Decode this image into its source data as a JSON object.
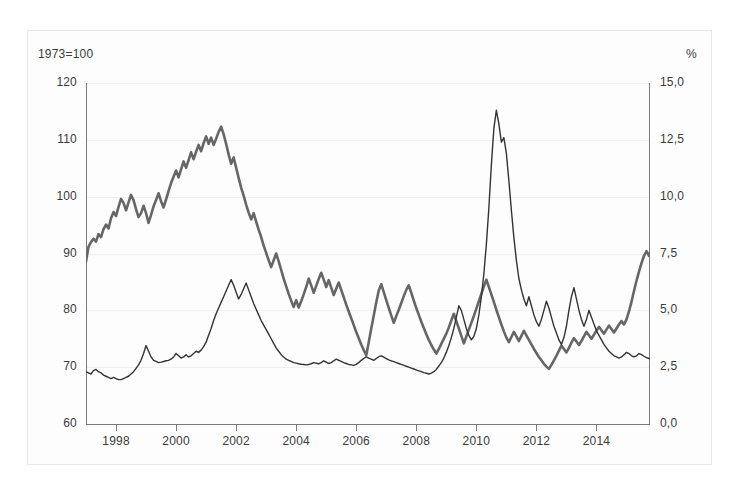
{
  "chart_data": {
    "type": "line",
    "title": "",
    "subtitle": "",
    "left_axis": {
      "caption": "1973=100",
      "label": "1973=100",
      "ticks": [
        "120",
        "110",
        "100",
        "90",
        "80",
        "70",
        "60"
      ],
      "tick_values": [
        120,
        110,
        100,
        90,
        80,
        70,
        60
      ],
      "ylim": [
        60,
        120
      ]
    },
    "right_axis": {
      "caption": "%",
      "label": "%",
      "ticks": [
        "15,0",
        "12,5",
        "10,0",
        "7,5",
        "5,0",
        "2,5",
        "0,0"
      ],
      "tick_values": [
        15.0,
        12.5,
        10.0,
        7.5,
        5.0,
        2.5,
        0.0
      ],
      "ylim": [
        0,
        15
      ]
    },
    "xlabel": "",
    "x_ticks": [
      "1998",
      "2000",
      "2002",
      "2004",
      "2006",
      "2008",
      "2010",
      "2012",
      "2014"
    ],
    "x_tick_values": [
      1998,
      2000,
      2002,
      2004,
      2006,
      2008,
      2010,
      2012,
      2014
    ],
    "xlim": [
      1997.0,
      2015.75
    ],
    "grid": true,
    "legend_position": "none",
    "colors": {
      "index_series": "#666666",
      "rate_series": "#333333",
      "grid": "#f0f0f0",
      "axis": "#7a7a7a",
      "frame": "#e8e8e8",
      "background": "#fdfdfd",
      "text": "#3a3a3a"
    },
    "series": [
      {
        "name": "Index (1973=100)",
        "axis": "left",
        "color": "#666666",
        "width": 2.6,
        "x_start": 1997.0,
        "x_step": 0.0833333,
        "values": [
          88.6,
          91.2,
          92.0,
          92.6,
          92.1,
          93.4,
          92.9,
          94.3,
          95.1,
          94.4,
          96.2,
          97.3,
          96.6,
          98.2,
          99.6,
          98.9,
          97.6,
          99.0,
          100.3,
          99.4,
          97.8,
          96.4,
          97.1,
          98.4,
          97.1,
          95.4,
          96.8,
          98.3,
          99.4,
          100.6,
          99.2,
          98.1,
          99.5,
          101.0,
          102.4,
          103.5,
          104.6,
          103.4,
          104.8,
          106.2,
          105.1,
          106.4,
          107.8,
          106.6,
          107.9,
          109.1,
          108.0,
          109.4,
          110.6,
          109.3,
          110.4,
          109.1,
          110.2,
          111.4,
          112.3,
          111.0,
          109.3,
          107.4,
          105.8,
          106.9,
          105.1,
          103.3,
          101.6,
          100.2,
          98.6,
          97.2,
          96.0,
          97.1,
          95.6,
          94.2,
          92.9,
          91.4,
          90.1,
          88.8,
          87.6,
          88.8,
          90.0,
          88.6,
          87.1,
          85.6,
          84.2,
          82.9,
          81.7,
          80.6,
          81.8,
          80.5,
          81.6,
          82.8,
          84.1,
          85.6,
          84.4,
          83.1,
          84.3,
          85.5,
          86.6,
          85.4,
          84.1,
          85.3,
          84.0,
          82.7,
          83.8,
          84.9,
          83.6,
          82.3,
          81.0,
          79.8,
          78.6,
          77.4,
          76.2,
          75.1,
          74.0,
          73.0,
          72.1,
          74.4,
          76.8,
          79.1,
          81.4,
          83.5,
          84.6,
          83.2,
          81.8,
          80.4,
          79.1,
          77.8,
          79.0,
          80.1,
          81.3,
          82.5,
          83.6,
          84.4,
          83.1,
          81.7,
          80.4,
          79.2,
          78.0,
          76.9,
          75.8,
          74.8,
          73.9,
          73.1,
          72.4,
          73.2,
          74.1,
          75.0,
          75.9,
          77.0,
          78.2,
          79.4,
          78.1,
          76.8,
          75.5,
          74.2,
          75.4,
          76.6,
          77.8,
          79.0,
          80.3,
          81.6,
          82.9,
          84.2,
          85.4,
          84.1,
          82.8,
          81.5,
          80.1,
          78.8,
          77.5,
          76.3,
          75.2,
          74.4,
          75.3,
          76.2,
          75.4,
          74.6,
          75.5,
          76.4,
          75.6,
          74.8,
          74.0,
          73.2,
          72.5,
          71.8,
          71.2,
          70.6,
          70.1,
          69.7,
          70.4,
          71.2,
          72.0,
          72.9,
          73.8,
          73.2,
          72.6,
          73.4,
          74.3,
          75.1,
          74.5,
          73.9,
          74.6,
          75.4,
          76.2,
          75.6,
          75.0,
          75.7,
          76.4,
          77.1,
          76.5,
          75.9,
          76.6,
          77.3,
          76.7,
          76.1,
          76.8,
          77.5,
          78.1,
          77.5,
          78.4,
          79.8,
          81.5,
          83.4,
          85.2,
          86.8,
          88.3,
          89.6,
          90.4,
          89.6,
          90.8,
          92.0,
          91.2,
          92.4,
          93.0,
          92.2,
          93.2,
          93.8
        ]
      },
      {
        "name": "Rate (%)",
        "axis": "right",
        "color": "#333333",
        "width": 1.4,
        "x_start": 1997.0,
        "x_step": 0.0833333,
        "values": [
          2.3,
          2.25,
          2.2,
          2.35,
          2.4,
          2.3,
          2.25,
          2.15,
          2.1,
          2.05,
          2.0,
          2.05,
          2.0,
          1.95,
          1.95,
          2.0,
          2.05,
          2.1,
          2.2,
          2.3,
          2.45,
          2.6,
          2.8,
          3.1,
          3.45,
          3.2,
          2.95,
          2.8,
          2.75,
          2.7,
          2.72,
          2.75,
          2.78,
          2.8,
          2.85,
          2.95,
          3.1,
          3.0,
          2.9,
          2.95,
          3.05,
          2.95,
          3.0,
          3.1,
          3.2,
          3.15,
          3.25,
          3.4,
          3.6,
          3.9,
          4.2,
          4.55,
          4.85,
          5.1,
          5.35,
          5.6,
          5.85,
          6.1,
          6.35,
          6.1,
          5.8,
          5.5,
          5.7,
          5.95,
          6.2,
          5.9,
          5.6,
          5.3,
          5.05,
          4.8,
          4.55,
          4.35,
          4.15,
          3.95,
          3.75,
          3.55,
          3.35,
          3.2,
          3.05,
          2.95,
          2.85,
          2.8,
          2.75,
          2.7,
          2.68,
          2.65,
          2.63,
          2.62,
          2.6,
          2.62,
          2.65,
          2.7,
          2.68,
          2.65,
          2.7,
          2.78,
          2.72,
          2.66,
          2.7,
          2.78,
          2.85,
          2.8,
          2.75,
          2.7,
          2.66,
          2.62,
          2.6,
          2.58,
          2.62,
          2.7,
          2.8,
          2.88,
          2.95,
          2.9,
          2.85,
          2.8,
          2.88,
          2.96,
          3.0,
          2.94,
          2.88,
          2.82,
          2.78,
          2.74,
          2.7,
          2.66,
          2.62,
          2.58,
          2.54,
          2.5,
          2.46,
          2.42,
          2.38,
          2.34,
          2.3,
          2.26,
          2.23,
          2.2,
          2.24,
          2.3,
          2.4,
          2.55,
          2.7,
          2.9,
          3.15,
          3.45,
          3.8,
          4.2,
          4.7,
          5.2,
          5.0,
          4.6,
          4.2,
          3.9,
          3.7,
          3.85,
          4.2,
          4.8,
          5.6,
          6.6,
          7.9,
          9.5,
          11.4,
          13.0,
          13.8,
          13.2,
          12.4,
          12.6,
          11.9,
          10.7,
          9.4,
          8.2,
          7.2,
          6.4,
          5.9,
          5.5,
          5.2,
          5.6,
          5.2,
          4.8,
          4.5,
          4.3,
          4.6,
          5.0,
          5.4,
          5.1,
          4.7,
          4.3,
          4.0,
          3.7,
          3.5,
          3.8,
          4.3,
          5.0,
          5.6,
          6.0,
          5.5,
          5.0,
          4.6,
          4.3,
          4.6,
          5.0,
          4.7,
          4.4,
          4.1,
          3.9,
          3.7,
          3.5,
          3.35,
          3.2,
          3.1,
          3.0,
          2.95,
          2.9,
          2.95,
          3.05,
          3.15,
          3.1,
          3.0,
          2.95,
          3.0,
          3.1,
          3.05,
          2.98,
          2.92,
          2.88,
          2.85,
          2.9,
          3.0,
          3.2,
          3.1,
          3.0,
          3.1,
          3.3,
          3.55,
          3.35,
          3.2,
          3.4,
          3.7,
          4.0,
          3.8,
          3.6,
          3.85,
          4.2,
          4.6,
          4.3,
          4.55
        ]
      }
    ]
  }
}
